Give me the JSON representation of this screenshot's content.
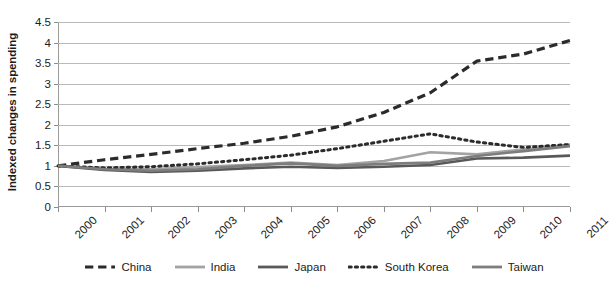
{
  "figure": {
    "top_partial_text": "",
    "background": "#ffffff"
  },
  "axes": {
    "y_title": "Indexed changes in spending",
    "y_ticks": [
      "0",
      "0.5",
      "1",
      "1.5",
      "2",
      "2.5",
      "3",
      "3.5",
      "4",
      "4.5"
    ],
    "x_ticks": [
      "2000",
      "2001",
      "2002",
      "2003",
      "2004",
      "2005",
      "2006",
      "2007",
      "2008",
      "2009",
      "2010",
      "2011"
    ]
  },
  "legend": {
    "position": "bottom",
    "items": [
      {
        "label": "China",
        "style": "dashed",
        "color": "#2b2b2b"
      },
      {
        "label": "India",
        "style": "solid",
        "color": "#a3a3a3"
      },
      {
        "label": "Japan",
        "style": "solid",
        "color": "#595959"
      },
      {
        "label": "South Korea",
        "style": "dotted",
        "color": "#2b2b2b"
      },
      {
        "label": "Taiwan",
        "style": "solid",
        "color": "#7d7d7d"
      }
    ]
  },
  "chart_data": {
    "type": "line",
    "title": "",
    "xlabel": "",
    "ylabel": "Indexed changes in spending",
    "x": [
      2000,
      2001,
      2002,
      2003,
      2004,
      2005,
      2006,
      2007,
      2008,
      2009,
      2010,
      2011
    ],
    "categories": [
      "2000",
      "2001",
      "2002",
      "2003",
      "2004",
      "2005",
      "2006",
      "2007",
      "2008",
      "2009",
      "2010",
      "2011"
    ],
    "ylim": [
      0,
      4.5
    ],
    "ytick_step": 0.5,
    "grid": "horizontal",
    "legend_position": "bottom",
    "series": [
      {
        "name": "China",
        "style": "dashed",
        "color": "#2b2b2b",
        "values": [
          1.0,
          1.15,
          1.28,
          1.42,
          1.55,
          1.72,
          1.95,
          2.3,
          2.78,
          3.55,
          3.72,
          4.05
        ]
      },
      {
        "name": "India",
        "style": "solid",
        "color": "#a3a3a3",
        "values": [
          1.0,
          0.93,
          0.92,
          0.97,
          1.02,
          1.08,
          1.02,
          1.12,
          1.33,
          1.28,
          1.4,
          1.52
        ]
      },
      {
        "name": "Japan",
        "style": "solid",
        "color": "#595959",
        "values": [
          1.0,
          0.9,
          0.85,
          0.88,
          0.94,
          0.98,
          0.95,
          0.98,
          1.02,
          1.18,
          1.2,
          1.25
        ]
      },
      {
        "name": "South Korea",
        "style": "dotted",
        "color": "#2b2b2b",
        "values": [
          1.0,
          0.95,
          0.98,
          1.05,
          1.15,
          1.26,
          1.42,
          1.6,
          1.78,
          1.58,
          1.45,
          1.52
        ]
      },
      {
        "name": "Taiwan",
        "style": "solid",
        "color": "#7d7d7d",
        "values": [
          1.0,
          0.92,
          0.88,
          0.92,
          1.0,
          1.06,
          1.0,
          1.05,
          1.08,
          1.24,
          1.36,
          1.48
        ]
      }
    ],
    "south_korea_tail": [
      1.0,
      0.95,
      0.98,
      1.05,
      1.15,
      1.26,
      1.42,
      1.6,
      1.78,
      1.58,
      1.45,
      1.7
    ]
  }
}
